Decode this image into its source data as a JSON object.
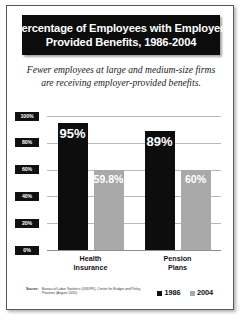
{
  "figure": {
    "title_lines": [
      "Percentage of Employees with Employer-",
      "Provided Benefits, 1986-2004"
    ],
    "subtitle_lines": [
      "Fewer employees at large and medium-size firms",
      "are receiving employer-provided benefits."
    ],
    "source_label": "Source:",
    "source_text": "Bureau of Labor Statistics (USDPK), Center for Budget and Policy Priorities (August 2005)"
  },
  "colors": {
    "series_1986": "#0d0d0e",
    "series_2004": "#a9a9aa",
    "title_background": "#0c0c0d",
    "gridline": "#b9b9ba",
    "page_border": "#59595a"
  },
  "chart_data": {
    "type": "bar",
    "subtitle": "Fewer employees at large and medium-size firms are receiving employer-provided benefits.",
    "categories": [
      "Health Insurance",
      "Pension Plans"
    ],
    "category_lines": [
      [
        "Health",
        "Insurance"
      ],
      [
        "Pension",
        "Plans"
      ]
    ],
    "series": [
      {
        "name": "1986",
        "color": "#0d0d0e",
        "values": [
          95,
          89
        ],
        "labels": [
          "95%",
          "89%"
        ]
      },
      {
        "name": "2004",
        "color": "#a9a9aa",
        "values": [
          59.8,
          60
        ],
        "labels": [
          "59.8%",
          "60%"
        ]
      }
    ],
    "xlabel": "",
    "ylabel": "",
    "ylim": [
      0,
      100
    ],
    "yticks": [
      0,
      20,
      40,
      60,
      80,
      100
    ],
    "ytick_labels": [
      "0%",
      "20%",
      "40%",
      "60%",
      "80%",
      "100%"
    ],
    "grid": true,
    "legend_position": "bottom-right",
    "legend_entries": [
      "1986",
      "2004"
    ]
  }
}
